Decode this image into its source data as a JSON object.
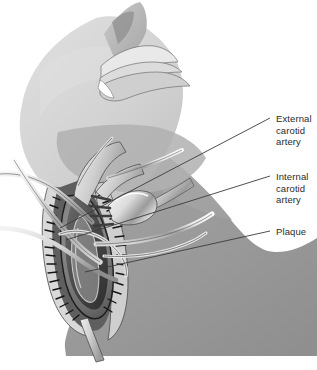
{
  "figure": {
    "width": 317,
    "height": 370,
    "background_color": "#ffffff"
  },
  "palette": {
    "skin_light": "#d6d6d6",
    "skin_mid": "#ababab",
    "skin_body": "#9a9a9a",
    "skin_shadow": "#8d8d8d",
    "vessel_light": "#e2e2e2",
    "vessel_mid": "#bdbdbd",
    "plaque_dark": "#2a2a2a",
    "plaque_mid": "#545454",
    "instrument_light": "#f2f2f2",
    "instrument_mid": "#c2c2c2",
    "instrument_dark": "#7a7a7a",
    "outline": "#3a3a3a",
    "leader_line": "#3b3b3b",
    "label_text": "#2b2b2b"
  },
  "labels": [
    {
      "id": "external-carotid",
      "text": "External\ncarotid\nartery",
      "leader": {
        "x1": 270,
        "y1": 118,
        "x2": 60,
        "y2": 228
      }
    },
    {
      "id": "internal-carotid",
      "text": "Internal\ncarotid\nartery",
      "leader": {
        "x1": 270,
        "y1": 176,
        "x2": 66,
        "y2": 240
      }
    },
    {
      "id": "plaque",
      "text": "Plaque",
      "leader": {
        "x1": 270,
        "y1": 231,
        "x2": 85,
        "y2": 272
      }
    }
  ],
  "anatomy": {
    "head": "head tilted back in left profile, top of image",
    "nose_chin": "nose and chin profile at upper center",
    "neck": "extended neck sweeping down-left",
    "shoulder": "shoulder and upper chest mass, lower right",
    "incision": "vertical neck incision exposing carotid bifurcation",
    "artery": "opened carotid artery with atherosclerotic plaque",
    "instruments": "fork-shaped self-retaining retractor, vessel loops, curved clamps"
  }
}
